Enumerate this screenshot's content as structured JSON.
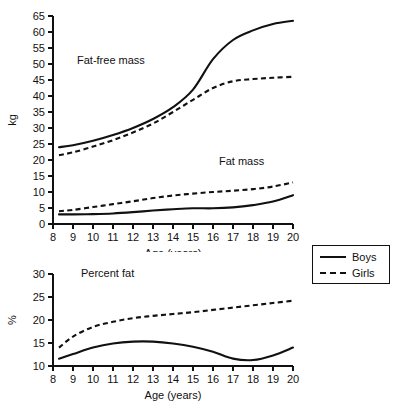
{
  "figure": {
    "background_color": "#ffffff",
    "line_color": "#111111"
  },
  "legend": {
    "position": "right",
    "entries": [
      {
        "label": "Boys",
        "style": "solid"
      },
      {
        "label": "Girls",
        "style": "dashed"
      }
    ]
  },
  "chart_data": [
    {
      "id": "body-composition-mass",
      "type": "line",
      "title": "",
      "xlabel": "Age (years)",
      "ylabel": "kg",
      "xlim": [
        8,
        20
      ],
      "ylim": [
        0,
        65
      ],
      "xticks": [
        8,
        9,
        10,
        11,
        12,
        13,
        14,
        15,
        16,
        17,
        18,
        19,
        20
      ],
      "yticks": [
        0,
        5,
        10,
        15,
        20,
        25,
        30,
        35,
        40,
        45,
        50,
        55,
        60,
        65
      ],
      "grid": false,
      "annotations": [
        {
          "text": "Fat-free mass",
          "x": 9.2,
          "y": 50
        },
        {
          "text": "Fat mass",
          "x": 16.3,
          "y": 18.5
        }
      ],
      "x": [
        8.3,
        9,
        10,
        11,
        12,
        13,
        14,
        15,
        16,
        17,
        18,
        19,
        20
      ],
      "series": [
        {
          "name": "Boys fat-free mass",
          "style": "solid",
          "values": [
            24.0,
            24.6,
            26.0,
            27.8,
            30.0,
            32.8,
            36.5,
            42.0,
            51.5,
            57.5,
            60.5,
            62.5,
            63.5
          ]
        },
        {
          "name": "Girls fat-free mass",
          "style": "dashed",
          "values": [
            21.5,
            22.4,
            24.2,
            26.2,
            28.6,
            31.4,
            35.0,
            38.8,
            42.5,
            44.6,
            45.3,
            45.7,
            46.0
          ]
        },
        {
          "name": "Boys fat mass",
          "style": "solid",
          "values": [
            3.0,
            3.0,
            3.1,
            3.3,
            3.7,
            4.2,
            4.6,
            4.9,
            4.9,
            5.2,
            5.9,
            7.0,
            9.0
          ]
        },
        {
          "name": "Girls fat mass",
          "style": "dashed",
          "values": [
            4.0,
            4.4,
            5.3,
            6.2,
            7.1,
            8.1,
            8.9,
            9.5,
            10.0,
            10.4,
            10.9,
            11.7,
            13.0
          ]
        }
      ]
    },
    {
      "id": "percent-body-fat",
      "type": "line",
      "title": "",
      "xlabel": "Age (years)",
      "ylabel": "%",
      "xlim": [
        8,
        20
      ],
      "ylim": [
        10,
        30
      ],
      "xticks": [
        8,
        9,
        10,
        11,
        12,
        13,
        14,
        15,
        16,
        17,
        18,
        19,
        20
      ],
      "yticks": [
        10,
        15,
        20,
        25,
        30
      ],
      "grid": false,
      "annotations": [
        {
          "text": "Percent fat",
          "x": 9.4,
          "y": 29.4
        }
      ],
      "x": [
        8.3,
        9,
        10,
        11,
        12,
        13,
        14,
        15,
        16,
        17,
        18,
        19,
        20
      ],
      "series": [
        {
          "name": "Boys percent fat",
          "style": "solid",
          "values": [
            11.6,
            12.6,
            14.0,
            14.9,
            15.3,
            15.3,
            14.9,
            14.2,
            13.1,
            11.6,
            11.3,
            12.3,
            14.0
          ]
        },
        {
          "name": "Girls percent fat",
          "style": "dashed",
          "values": [
            14.0,
            16.4,
            18.5,
            19.6,
            20.4,
            20.9,
            21.3,
            21.7,
            22.2,
            22.7,
            23.2,
            23.7,
            24.2
          ]
        }
      ]
    }
  ]
}
